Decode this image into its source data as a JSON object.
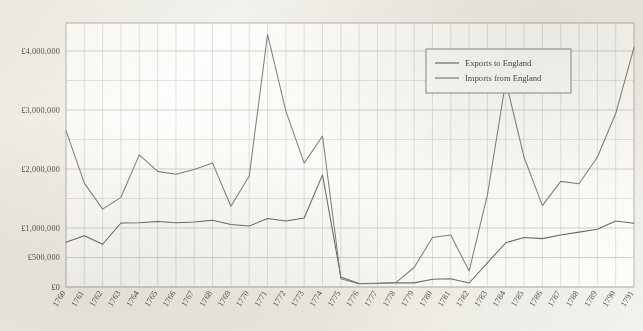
{
  "chart_data": {
    "type": "line",
    "title": "",
    "subtitle": "",
    "xlabel": "",
    "ylabel": "",
    "grid": true,
    "legend_position": "top-right",
    "xlim": [
      1760,
      1791
    ],
    "ylim": [
      0,
      5400000
    ],
    "y_ticks": [
      0,
      500000,
      1000000,
      2000000,
      3000000,
      4000000,
      5000000
    ],
    "y_tick_labels": [
      "£0",
      "£500,000",
      "£1,000,000",
      "£2,000,000",
      "£3,000,000",
      "£4,000,000",
      "£5,000,000"
    ],
    "categories": [
      "1760",
      "1761",
      "1762",
      "1763",
      "1764",
      "1765",
      "1766",
      "1767",
      "1768",
      "1769",
      "1770",
      "1771",
      "1772",
      "1773",
      "1774",
      "1775",
      "1776",
      "1777",
      "1778",
      "1779",
      "1780",
      "1781",
      "1782",
      "1783",
      "1784",
      "1785",
      "1786",
      "1787",
      "1788",
      "1789",
      "1790",
      "1791"
    ],
    "series": [
      {
        "name": "Exports to England",
        "color": "#6e6c66",
        "values": [
          760000,
          870000,
          725000,
          1085000,
          1090000,
          1110000,
          1090000,
          1100000,
          1130000,
          1060000,
          1035000,
          1160000,
          1120000,
          1170000,
          1900000,
          170000,
          60000,
          65000,
          72000,
          70000,
          130000,
          140000,
          68000,
          410000,
          750000,
          840000,
          820000,
          880000,
          930000,
          980000,
          1120000,
          1080000
        ]
      },
      {
        "name": "Imports from England",
        "color": "#84827b",
        "values": [
          2650000,
          1760000,
          1320000,
          1520000,
          2240000,
          1960000,
          1910000,
          1990000,
          2100000,
          1370000,
          1880000,
          4280000,
          2980000,
          2100000,
          2560000,
          140000,
          55000,
          60000,
          75000,
          330000,
          840000,
          880000,
          270000,
          1560000,
          3490000,
          2200000,
          1380000,
          1790000,
          1750000,
          2200000,
          2940000,
          4060000
        ]
      }
    ],
    "legend": [
      {
        "label": "Exports to England",
        "color": "#6e6c66"
      },
      {
        "label": "Imports from England",
        "color": "#84827b"
      }
    ]
  }
}
